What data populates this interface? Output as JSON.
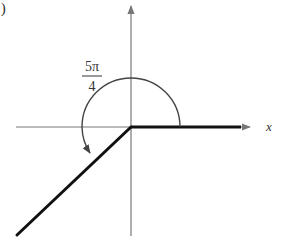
{
  "figure": {
    "part_label": ")",
    "axis_x_label": "x",
    "angle_label": {
      "numerator": "5π",
      "denominator": "4"
    },
    "angle_radians_fraction_of_pi": 1.25,
    "angle_degrees": 225,
    "initial_side": "positive x-axis",
    "terminal_side_quadrant": "III",
    "rotation": "counterclockwise",
    "colors": {
      "axes": "#777777",
      "rays": "#111111",
      "arc": "#444444",
      "text": "#333333"
    }
  }
}
